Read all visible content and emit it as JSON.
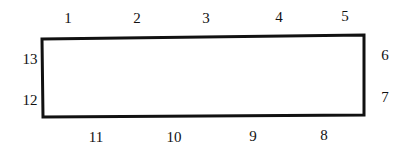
{
  "diagram": {
    "shape": "rectangle",
    "stroke_color": "#111111",
    "corners": {
      "top_left": [
        42,
        39
      ],
      "top_right": [
        364,
        35
      ],
      "bottom_right": [
        364,
        115
      ],
      "bottom_left": [
        43,
        117
      ]
    },
    "labels": [
      {
        "text": "1",
        "x": 68,
        "y": 18,
        "side": "top"
      },
      {
        "text": "2",
        "x": 137,
        "y": 18,
        "side": "top"
      },
      {
        "text": "3",
        "x": 206,
        "y": 18,
        "side": "top"
      },
      {
        "text": "4",
        "x": 279,
        "y": 17,
        "side": "top"
      },
      {
        "text": "5",
        "x": 345,
        "y": 16,
        "side": "top"
      },
      {
        "text": "6",
        "x": 385,
        "y": 55,
        "side": "right"
      },
      {
        "text": "7",
        "x": 385,
        "y": 97,
        "side": "right"
      },
      {
        "text": "8",
        "x": 324,
        "y": 135,
        "side": "bottom"
      },
      {
        "text": "9",
        "x": 253,
        "y": 136,
        "side": "bottom"
      },
      {
        "text": "10",
        "x": 174,
        "y": 137,
        "side": "bottom"
      },
      {
        "text": "11",
        "x": 96,
        "y": 137,
        "side": "bottom"
      },
      {
        "text": "12",
        "x": 30,
        "y": 100,
        "side": "left"
      },
      {
        "text": "13",
        "x": 30,
        "y": 59,
        "side": "left"
      }
    ]
  }
}
